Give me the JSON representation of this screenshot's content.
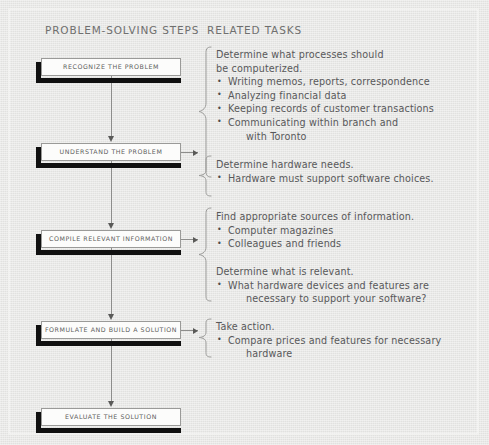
{
  "headers": {
    "left": "PROBLEM-SOLVING STEPS",
    "right": "RELATED TASKS"
  },
  "steps": [
    {
      "label": "RECOGNIZE THE PROBLEM"
    },
    {
      "label": "UNDERSTAND THE PROBLEM"
    },
    {
      "label": "COMPILE RELEVANT INFORMATION"
    },
    {
      "label": "FORMULATE AND BUILD A SOLUTION"
    },
    {
      "label": "EVALUATE THE SOLUTION"
    }
  ],
  "tasks": [
    {
      "heading": "Determine what processes should\nbe computerized.",
      "items": [
        {
          "text": "Writing memos, reports, correspondence",
          "cont": ""
        },
        {
          "text": "Analyzing financial data",
          "cont": ""
        },
        {
          "text": "Keeping records of customer transactions",
          "cont": ""
        },
        {
          "text": "Communicating within branch and",
          "cont": "with Toronto"
        }
      ]
    },
    {
      "heading": "Determine hardware needs.",
      "items": [
        {
          "text": "Hardware must support software choices.",
          "cont": ""
        }
      ]
    },
    {
      "heading": "Find appropriate sources of information.",
      "items": [
        {
          "text": "Computer magazines",
          "cont": ""
        },
        {
          "text": "Colleagues and friends",
          "cont": ""
        }
      ]
    },
    {
      "heading": "Determine what is relevant.",
      "items": [
        {
          "text": "What hardware devices and features are",
          "cont": "necessary to support your software?"
        }
      ]
    },
    {
      "heading": "Take action.",
      "items": [
        {
          "text": "Compare prices and features for necessary",
          "cont": "hardware"
        }
      ]
    }
  ],
  "colors": {
    "background": "#e7e7e5",
    "box_fill": "#fcfcfb",
    "box_border": "#9a9a98",
    "shadow": "#101010",
    "connector": "#8d8d8b",
    "text": "#58585a",
    "header_text": "#6f6f6e"
  }
}
